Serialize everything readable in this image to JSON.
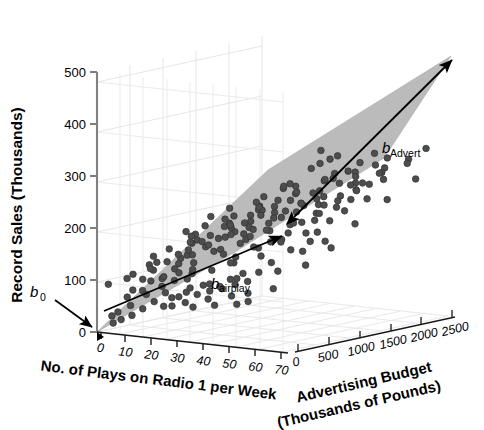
{
  "figure": {
    "background_color": "#ffffff",
    "plane_color": "#b3b3b3",
    "point_color": "#4d4d4d",
    "point_edge_color": "#333333",
    "grid_color": "#e2e2e2",
    "axis_color": "#7a7a7a",
    "annotation_color": "#000000"
  },
  "chart_data": {
    "type": "scatter",
    "title": "",
    "subtitle": "",
    "projection": "3d",
    "grid": true,
    "legend": null,
    "zlabel": "Record Sales (Thousands)",
    "zticks": [
      0,
      100,
      200,
      300,
      400,
      500
    ],
    "zlim": [
      0,
      550
    ],
    "xlabel": "No. of Plays on Radio 1 per Week",
    "xticks": [
      0,
      10,
      20,
      30,
      40,
      50,
      60,
      70
    ],
    "xlim": [
      0,
      75
    ],
    "ylabel": "Advertising Budget\n(Thousands of Pounds)",
    "ylabel_line1": "Advertising Budget",
    "ylabel_line2": "(Thousands of Pounds)",
    "yticks": [
      0,
      500,
      1000,
      1500,
      2000,
      2500
    ],
    "ylim": [
      0,
      2600
    ],
    "annotations": [
      {
        "id": "b0",
        "label": "b",
        "subscript": "0",
        "describes": "intercept at origin of record sales axis"
      },
      {
        "id": "b_airplay",
        "label": "b",
        "subscript": "airplay",
        "describes": "slope along number of plays axis"
      },
      {
        "id": "b_advert",
        "label": "b",
        "subscript": "Advert",
        "describes": "slope along advertising budget axis"
      }
    ],
    "series": [
      {
        "name": "Record sales observations",
        "marker": "filled-circle",
        "points": [
          [
            3,
            60,
            101
          ],
          [
            6,
            240,
            110
          ],
          [
            9,
            210,
            88
          ],
          [
            11,
            130,
            125
          ],
          [
            12,
            970,
            142
          ],
          [
            13,
            380,
            157
          ],
          [
            14,
            1660,
            173
          ],
          [
            15,
            120,
            93
          ],
          [
            16,
            310,
            148
          ],
          [
            17,
            1940,
            221
          ],
          [
            18,
            130,
            115
          ],
          [
            19,
            840,
            182
          ],
          [
            20,
            2200,
            253
          ],
          [
            21,
            190,
            120
          ],
          [
            22,
            450,
            156
          ],
          [
            23,
            1120,
            205
          ],
          [
            24,
            270,
            140
          ],
          [
            25,
            1590,
            228
          ],
          [
            26,
            690,
            176
          ],
          [
            27,
            140,
            121
          ],
          [
            28,
            2070,
            266
          ],
          [
            29,
            980,
            210
          ],
          [
            30,
            330,
            155
          ],
          [
            31,
            1400,
            236
          ],
          [
            32,
            760,
            198
          ],
          [
            33,
            180,
            138
          ],
          [
            34,
            1820,
            261
          ],
          [
            35,
            1050,
            225
          ],
          [
            36,
            520,
            181
          ],
          [
            37,
            2330,
            291
          ],
          [
            38,
            900,
            218
          ],
          [
            39,
            1530,
            258
          ],
          [
            40,
            400,
            177
          ],
          [
            41,
            1190,
            243
          ],
          [
            42,
            2100,
            290
          ],
          [
            43,
            640,
            203
          ],
          [
            44,
            1690,
            272
          ],
          [
            45,
            1010,
            239
          ],
          [
            46,
            350,
            176
          ],
          [
            47,
            2250,
            302
          ],
          [
            48,
            1330,
            263
          ],
          [
            49,
            780,
            221
          ],
          [
            50,
            1870,
            291
          ],
          [
            51,
            1130,
            252
          ],
          [
            52,
            470,
            195
          ],
          [
            53,
            2010,
            303
          ],
          [
            54,
            1450,
            277
          ],
          [
            55,
            860,
            235
          ],
          [
            56,
            2400,
            333
          ],
          [
            57,
            1240,
            268
          ],
          [
            58,
            600,
            213
          ],
          [
            59,
            1760,
            300
          ],
          [
            60,
            1080,
            256
          ],
          [
            61,
            2150,
            322
          ],
          [
            62,
            1390,
            285
          ],
          [
            63,
            930,
            247
          ],
          [
            64,
            1980,
            319
          ],
          [
            65,
            1520,
            296
          ],
          [
            66,
            1160,
            270
          ],
          [
            67,
            2290,
            340
          ],
          [
            68,
            1610,
            307
          ],
          [
            69,
            1270,
            285
          ],
          [
            70,
            2450,
            360
          ],
          [
            21,
            60,
            75
          ],
          [
            24,
            90,
            66
          ],
          [
            26,
            140,
            84
          ],
          [
            28,
            60,
            70
          ],
          [
            30,
            210,
            96
          ],
          [
            32,
            110,
            78
          ],
          [
            34,
            320,
            110
          ],
          [
            36,
            70,
            72
          ],
          [
            38,
            260,
            102
          ],
          [
            40,
            150,
            89
          ],
          [
            42,
            430,
            124
          ],
          [
            44,
            90,
            80
          ],
          [
            46,
            340,
            118
          ],
          [
            48,
            200,
            99
          ],
          [
            50,
            560,
            140
          ],
          [
            52,
            120,
            86
          ],
          [
            17,
            40,
            58
          ],
          [
            13,
            30,
            42
          ],
          [
            9,
            20,
            31
          ],
          [
            6,
            15,
            22
          ],
          [
            35,
            180,
            95
          ],
          [
            39,
            610,
            152
          ],
          [
            43,
            250,
            110
          ],
          [
            47,
            720,
            168
          ],
          [
            29,
            130,
            88
          ],
          [
            33,
            500,
            136
          ],
          [
            37,
            300,
            115
          ],
          [
            41,
            850,
            180
          ],
          [
            45,
            410,
            128
          ],
          [
            49,
            960,
            192
          ],
          [
            53,
            640,
            160
          ],
          [
            31,
            230,
            105
          ],
          [
            27,
            350,
            118
          ],
          [
            23,
            160,
            92
          ],
          [
            55,
            1120,
            210
          ],
          [
            57,
            790,
            185
          ],
          [
            25,
            520,
            132
          ],
          [
            19,
            270,
            100
          ],
          [
            15,
            180,
            83
          ],
          [
            11,
            90,
            60
          ],
          [
            59,
            1340,
            232
          ],
          [
            61,
            940,
            201
          ],
          [
            7,
            50,
            45
          ],
          [
            5,
            35,
            36
          ],
          [
            12,
            420,
            126
          ],
          [
            16,
            660,
            155
          ],
          [
            20,
            880,
            178
          ],
          [
            22,
            1240,
            208
          ],
          [
            18,
            740,
            163
          ],
          [
            14,
            560,
            141
          ],
          [
            10,
            330,
            108
          ],
          [
            8,
            160,
            74
          ],
          [
            26,
            1420,
            222
          ],
          [
            30,
            1700,
            248
          ],
          [
            34,
            1130,
            205
          ],
          [
            38,
            1490,
            236
          ],
          [
            42,
            1880,
            270
          ],
          [
            46,
            1290,
            221
          ],
          [
            50,
            1620,
            252
          ],
          [
            54,
            2080,
            288
          ],
          [
            24,
            820,
            175
          ],
          [
            28,
            1240,
            212
          ],
          [
            32,
            1560,
            240
          ],
          [
            36,
            1000,
            195
          ],
          [
            40,
            1340,
            228
          ],
          [
            44,
            1750,
            258
          ],
          [
            48,
            1120,
            206
          ],
          [
            52,
            1460,
            240
          ],
          [
            56,
            1900,
            278
          ],
          [
            22,
            640,
            158
          ],
          [
            27,
            1060,
            192
          ],
          [
            31,
            1380,
            226
          ],
          [
            35,
            880,
            183
          ],
          [
            43,
            1580,
            248
          ],
          [
            51,
            2010,
            284
          ],
          [
            23,
            380,
            128
          ],
          [
            29,
            700,
            168
          ],
          [
            33,
            1020,
            198
          ],
          [
            37,
            1260,
            216
          ],
          [
            41,
            1620,
            250
          ],
          [
            45,
            960,
            190
          ],
          [
            49,
            1300,
            224
          ],
          [
            53,
            1720,
            260
          ],
          [
            39,
            1140,
            206
          ],
          [
            25,
            940,
            186
          ],
          [
            57,
            2230,
            306
          ],
          [
            20,
            500,
            142
          ],
          [
            18,
            340,
            118
          ],
          [
            60,
            1540,
            248
          ],
          [
            62,
            2090,
            300
          ],
          [
            58,
            1180,
            212
          ],
          [
            64,
            1740,
            270
          ],
          [
            66,
            2310,
            330
          ],
          [
            16,
            880,
            172
          ],
          [
            14,
            1020,
            186
          ],
          [
            12,
            1260,
            196
          ],
          [
            10,
            760,
            160
          ],
          [
            8,
            520,
            132
          ],
          [
            30,
            2240,
            300
          ],
          [
            34,
            2380,
            318
          ],
          [
            26,
            1960,
            268
          ],
          [
            22,
            1800,
            248
          ],
          [
            28,
            2480,
            330
          ],
          [
            44,
            2260,
            302
          ],
          [
            38,
            2120,
            282
          ],
          [
            24,
            1640,
            232
          ],
          [
            18,
            1480,
            214
          ],
          [
            32,
            2300,
            310
          ],
          [
            36,
            2420,
            325
          ],
          [
            40,
            2050,
            288
          ],
          [
            46,
            2370,
            318
          ],
          [
            20,
            1340,
            200
          ],
          [
            16,
            1180,
            180
          ],
          [
            50,
            2440,
            338
          ],
          [
            54,
            2290,
            320
          ],
          [
            12,
            1020,
            168
          ],
          [
            6,
            620,
            120
          ],
          [
            9,
            1160,
            175
          ],
          [
            15,
            1460,
            206
          ],
          [
            21,
            1720,
            238
          ],
          [
            27,
            2020,
            272
          ],
          [
            33,
            1880,
            262
          ],
          [
            45,
            510,
            136
          ],
          [
            41,
            300,
            112
          ],
          [
            37,
            640,
            150
          ],
          [
            49,
            420,
            124
          ],
          [
            53,
            260,
            106
          ],
          [
            57,
            580,
            146
          ],
          [
            61,
            340,
            118
          ],
          [
            65,
            700,
            160
          ],
          [
            55,
            180,
            92
          ],
          [
            59,
            900,
            180
          ],
          [
            63,
            1100,
            198
          ],
          [
            67,
            1420,
            228
          ],
          [
            69,
            1860,
            268
          ],
          [
            71,
            2240,
            302
          ],
          [
            68,
            990,
            190
          ],
          [
            11,
            1700,
            220
          ],
          [
            5,
            1240,
            180
          ],
          [
            7,
            1560,
            204
          ]
        ]
      }
    ],
    "n_points": 200,
    "plane": {
      "description": "fitted regression plane (gray wedge) rising from origin toward high airplay and high advertising budget",
      "fill": "#b3b3b3"
    }
  }
}
